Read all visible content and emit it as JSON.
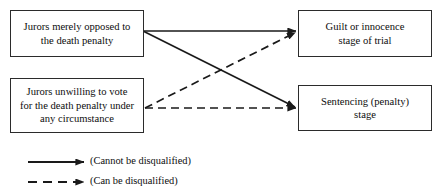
{
  "page": {
    "cropped_top_caption": "",
    "width": 437,
    "height": 191,
    "background_color": "#ffffff",
    "line_color": "#1a1a1a",
    "border_color": "#2b2b2b"
  },
  "diagram": {
    "type": "flow-diagram",
    "nodes": [
      {
        "id": "opposed",
        "label": "Jurors merely opposed to\nthe death penalty"
      },
      {
        "id": "unwilling",
        "label": "Jurors unwilling to vote\nfor the death penalty under\nany circumstance"
      },
      {
        "id": "guilt",
        "label": "Guilt or innocence\nstage of trial"
      },
      {
        "id": "sentence",
        "label": "Sentencing (penalty)\nstage"
      }
    ],
    "edges": [
      {
        "from": "opposed",
        "to": "guilt",
        "style": "solid",
        "meaning": "Cannot be disqualified"
      },
      {
        "from": "opposed",
        "to": "sentence",
        "style": "solid",
        "meaning": "Cannot be disqualified"
      },
      {
        "from": "unwilling",
        "to": "guilt",
        "style": "dashed",
        "meaning": "Can be disqualified"
      },
      {
        "from": "unwilling",
        "to": "sentence",
        "style": "dashed",
        "meaning": "Can be disqualified"
      }
    ]
  },
  "legend": {
    "solid": {
      "label": "(Cannot be disqualified)",
      "style": "solid"
    },
    "dashed": {
      "label": "(Can be disqualified)",
      "style": "dashed"
    }
  }
}
